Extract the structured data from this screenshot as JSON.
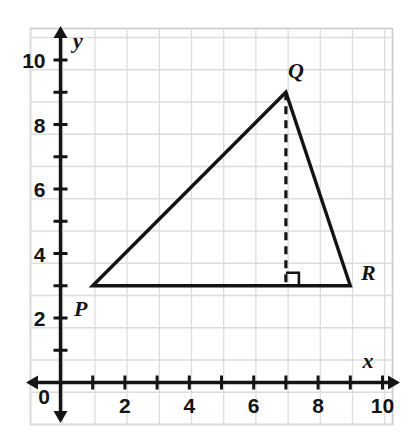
{
  "figure": {
    "background_color": "#ffffff",
    "frame_color": "#c9c9c9",
    "grid_color": "#dcdcdc",
    "axis_color": "#141414",
    "shape_color": "#141414"
  },
  "axes": {
    "x_label": "x",
    "y_label": "y",
    "origin_label": "0",
    "x_ticks": [
      {
        "value": 1,
        "label": ""
      },
      {
        "value": 2,
        "label": "2"
      },
      {
        "value": 3,
        "label": ""
      },
      {
        "value": 4,
        "label": "4"
      },
      {
        "value": 5,
        "label": ""
      },
      {
        "value": 6,
        "label": "6"
      },
      {
        "value": 7,
        "label": ""
      },
      {
        "value": 8,
        "label": "8"
      },
      {
        "value": 9,
        "label": ""
      },
      {
        "value": 10,
        "label": "10"
      }
    ],
    "y_ticks": [
      {
        "value": 1,
        "label": ""
      },
      {
        "value": 2,
        "label": "2"
      },
      {
        "value": 3,
        "label": ""
      },
      {
        "value": 4,
        "label": "4"
      },
      {
        "value": 5,
        "label": ""
      },
      {
        "value": 6,
        "label": "6"
      },
      {
        "value": 7,
        "label": ""
      },
      {
        "value": 8,
        "label": "8"
      },
      {
        "value": 9,
        "label": ""
      },
      {
        "value": 10,
        "label": "10"
      }
    ]
  },
  "chart_data": {
    "type": "scatter",
    "xlabel": "x",
    "ylabel": "y",
    "xlim": [
      0,
      10
    ],
    "ylim": [
      0,
      10
    ],
    "grid": true,
    "legend": "none",
    "points": [
      {
        "name": "P",
        "label": "P",
        "x": 1,
        "y": 3
      },
      {
        "name": "Q",
        "label": "Q",
        "x": 7,
        "y": 9
      },
      {
        "name": "R",
        "label": "R",
        "x": 9,
        "y": 3
      }
    ],
    "polygons": [
      {
        "name": "triangle-PQR",
        "vertices": [
          [
            1,
            3
          ],
          [
            7,
            9
          ],
          [
            9,
            3
          ]
        ],
        "style": "solid",
        "closed": true
      }
    ],
    "segments": [
      {
        "name": "altitude-from-Q",
        "from": [
          7,
          9
        ],
        "to": [
          7,
          3
        ],
        "style": "dashed"
      }
    ],
    "annotations": [
      {
        "name": "right-angle-marker",
        "at": [
          7,
          3
        ],
        "type": "right-angle",
        "orientation": "up-right"
      }
    ]
  },
  "labels": {
    "P": "P",
    "Q": "Q",
    "R": "R"
  }
}
